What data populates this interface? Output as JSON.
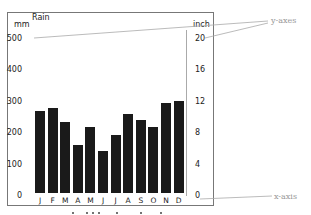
{
  "chart_data": {
    "type": "bar",
    "title": "Rain",
    "categories": [
      "J",
      "F",
      "M",
      "A",
      "M",
      "J",
      "J",
      "A",
      "S",
      "O",
      "N",
      "D"
    ],
    "values": [
      266,
      278,
      234,
      158,
      215,
      139,
      190,
      259,
      240,
      218,
      294,
      300
    ],
    "xlabel": "",
    "ylabel": "mm",
    "ylabel_right": "inch",
    "ylim": [
      0,
      500
    ],
    "ylim_right": [
      0,
      20
    ],
    "yticks": [
      0,
      100,
      200,
      300,
      400,
      500
    ],
    "yticks_right": [
      0,
      4,
      8,
      12,
      16,
      20
    ],
    "grid": false,
    "legend": null,
    "bar_color": "#1a1a1a",
    "annotations": [
      {
        "text": "y-axes",
        "points_to": [
          "left y-axis top (500)",
          "right y-axis top (20)"
        ]
      },
      {
        "text": "x-axis",
        "points_to": [
          "x-axis baseline (0)"
        ]
      }
    ]
  },
  "labels": {
    "title": "Rain",
    "left_unit": "mm",
    "right_unit": "inch",
    "y_axes_annotation": "y-axes",
    "x_axis_annotation": "x-axis",
    "left_ticks": [
      "500",
      "400",
      "300",
      "200",
      "100",
      "0"
    ],
    "right_ticks": [
      "20",
      "16",
      "12",
      "8",
      "4",
      "0"
    ],
    "months": [
      "J",
      "F",
      "M",
      "A",
      "M",
      "J",
      "J",
      "A",
      "S",
      "O",
      "N",
      "D"
    ]
  },
  "colors": {
    "bar": "#1a1a1a",
    "frame": "#777777",
    "annotation": "#999999"
  }
}
